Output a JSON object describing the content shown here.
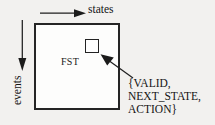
{
  "figure": {
    "name": "fst-table-diagram",
    "background_color": "#f2f1ef",
    "ink_color": "#1a1a1a"
  },
  "axes": {
    "horizontal": {
      "label": "states",
      "arrow_direction": "right",
      "icon": "arrow-right-icon"
    },
    "vertical": {
      "label": "events",
      "arrow_direction": "down",
      "icon": "arrow-down-icon"
    }
  },
  "box": {
    "label": "FST",
    "border_color": "#252525",
    "fill_color": "#fdfdfc"
  },
  "cell": {
    "name": "highlighted-entry",
    "border_color": "#232323",
    "fill_color": "#fefefe"
  },
  "callout": {
    "icon": "arrow-pointer-icon",
    "lines": [
      "{VALID,",
      "NEXT_STATE,",
      "ACTION}"
    ]
  }
}
